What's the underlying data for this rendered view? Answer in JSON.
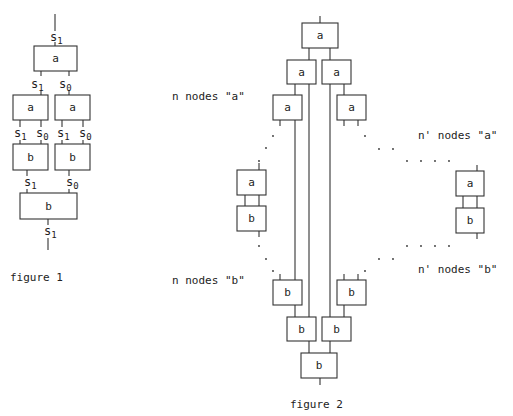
{
  "figure1": {
    "caption": "figure 1",
    "nodes": [
      {
        "id": "f1-top-a",
        "label": "a"
      },
      {
        "id": "f1-mid-a-left",
        "label": "a"
      },
      {
        "id": "f1-mid-a-right",
        "label": "a"
      },
      {
        "id": "f1-b-left",
        "label": "b"
      },
      {
        "id": "f1-b-right",
        "label": "b"
      },
      {
        "id": "f1-bottom-b",
        "label": "b"
      }
    ],
    "signals": {
      "top_in": {
        "base": "s",
        "sub": "1"
      },
      "a_top_out_left": {
        "base": "s",
        "sub": "1"
      },
      "a_top_out_right": {
        "base": "s",
        "sub": "0"
      },
      "a_left_out_1": {
        "base": "s",
        "sub": "1"
      },
      "a_left_out_0": {
        "base": "s",
        "sub": "0"
      },
      "a_right_out_1": {
        "base": "s",
        "sub": "1"
      },
      "a_right_out_0": {
        "base": "s",
        "sub": "0"
      },
      "b_in_left": {
        "base": "s",
        "sub": "1"
      },
      "b_in_right": {
        "base": "s",
        "sub": "0"
      },
      "bottom_out": {
        "base": "s",
        "sub": "1"
      }
    }
  },
  "figure2": {
    "caption": "figure 2",
    "labels": {
      "n_a": "n nodes \"a\"",
      "n_b": "n nodes \"b\"",
      "nprime_a": "n' nodes \"a\"",
      "nprime_b": "n' nodes \"b\""
    },
    "nodes": {
      "top": "a",
      "row2_left": "a",
      "row2_right": "a",
      "row3_left": "a",
      "row3_right": "a",
      "pair_left_a": "a",
      "pair_left_b": "b",
      "pair_right_a": "a",
      "pair_right_b": "b",
      "row3b_left": "b",
      "row3b_right": "b",
      "row2b_left": "b",
      "row2b_right": "b",
      "bottom": "b"
    }
  }
}
